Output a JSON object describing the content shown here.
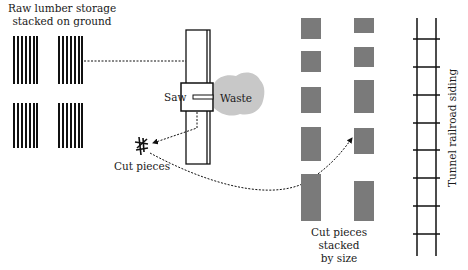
{
  "diagram": {
    "type": "plant-layout",
    "labels": {
      "raw_storage_line1": "Raw lumber storage",
      "raw_storage_line2": "stacked on ground",
      "saw": "Saw",
      "waste": "Waste",
      "cut_pieces": "Cut pieces",
      "stacked_line1": "Cut pieces",
      "stacked_line2": "stacked",
      "stacked_line3": "by size",
      "railroad": "Tunnel railroad siding"
    },
    "colors": {
      "ink": "#111111",
      "stack_gray": "#7a7a7a",
      "waste_gray": "#c8c8c8"
    },
    "flows": [
      {
        "from": "raw-lumber-storage",
        "to": "saw"
      },
      {
        "from": "saw",
        "to": "cut-pieces"
      },
      {
        "from": "cut-pieces",
        "to": "cut-pieces-stacked-by-size"
      }
    ]
  }
}
